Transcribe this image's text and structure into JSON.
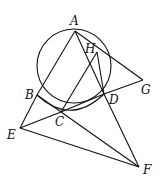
{
  "diagram": {
    "type": "geometry",
    "points": {
      "A": {
        "label": "A",
        "x": 75,
        "y": 31,
        "lx": 70,
        "ly": 25
      },
      "H": {
        "label": "H",
        "x": 97,
        "y": 52,
        "lx": 85,
        "ly": 53
      },
      "B": {
        "label": "B",
        "x": 37,
        "y": 95,
        "lx": 25,
        "ly": 99
      },
      "C": {
        "label": "C",
        "x": 61,
        "y": 112,
        "lx": 55,
        "ly": 126
      },
      "D": {
        "label": "D",
        "x": 104,
        "y": 94,
        "lx": 109,
        "ly": 104
      },
      "G": {
        "label": "G",
        "x": 143,
        "y": 80,
        "lx": 141,
        "ly": 94
      },
      "E": {
        "label": "E",
        "x": 20,
        "y": 128,
        "lx": 7,
        "ly": 139
      },
      "F": {
        "label": "F",
        "x": 139,
        "y": 167,
        "lx": 143,
        "ly": 174
      }
    },
    "circle": {
      "cx": 74,
      "cy": 66,
      "r": 37
    },
    "segments": [
      [
        "A",
        "B"
      ],
      [
        "A",
        "D"
      ],
      [
        "A",
        "G"
      ],
      [
        "D",
        "G"
      ],
      [
        "H",
        "C"
      ],
      [
        "H",
        "D"
      ],
      [
        "B",
        "E"
      ],
      [
        "E",
        "C"
      ],
      [
        "C",
        "D"
      ],
      [
        "E",
        "F"
      ],
      [
        "D",
        "F"
      ],
      [
        "B",
        "F"
      ]
    ],
    "arc_BD_inner": true
  }
}
